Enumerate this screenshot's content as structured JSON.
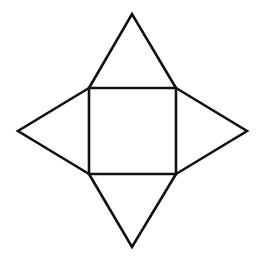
{
  "diagram": {
    "type": "square-pyramid-net",
    "stroke_color": "#111111",
    "background": "#ffffff",
    "square": {
      "x1": 89,
      "y1": 88,
      "x2": 176,
      "y2": 174
    },
    "apexes": {
      "top": [
        132,
        14
      ],
      "left": [
        18,
        131
      ],
      "right": [
        247,
        131
      ],
      "bottom": [
        132,
        247
      ]
    }
  }
}
